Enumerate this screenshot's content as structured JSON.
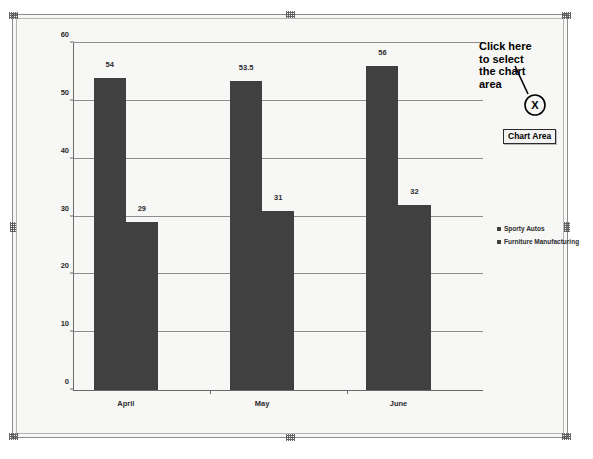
{
  "chart_data": {
    "type": "bar",
    "title": "",
    "xlabel": "",
    "ylabel": "",
    "categories": [
      "April",
      "May",
      "June"
    ],
    "series": [
      {
        "name": "Sporty Autos",
        "values": [
          54,
          53.5,
          56
        ],
        "color": "#404040"
      },
      {
        "name": "Furniture Manufacturing",
        "values": [
          29,
          31,
          32
        ],
        "color": "#404040"
      }
    ],
    "ylim": [
      0,
      60
    ],
    "yticks": [
      0,
      10,
      20,
      30,
      40,
      50,
      60
    ],
    "ytick_labels": [
      "0",
      "10",
      "20",
      "30",
      "40",
      "50",
      "60"
    ],
    "data_labels": [
      "54",
      "29",
      "53.5",
      "31",
      "56",
      "32"
    ],
    "grid": true,
    "legend_position": "right"
  },
  "legend": {
    "items": [
      {
        "label": "Sporty Autos"
      },
      {
        "label": "Furniture Manufacturing"
      }
    ]
  },
  "annotation": {
    "callout_line1": "Click here",
    "callout_line2": "to select",
    "callout_line3": "the chart",
    "callout_line4": "area",
    "marker_label": "X",
    "tooltip_label": "Chart Area"
  },
  "colors": {
    "bar": "#404040",
    "grid": "#8e8e8e",
    "axis": "#6a6a6a",
    "plot_background": "#f7f7f6",
    "frame_border": "#8c8c8c"
  }
}
